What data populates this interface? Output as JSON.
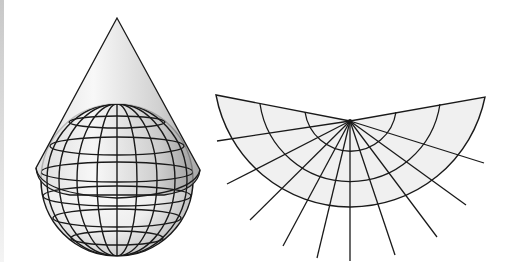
{
  "figure": {
    "panels": [
      {
        "id": "cone-globe",
        "label": "Cone placed over globe",
        "description": "A cone touching a globe along a standard parallel; globe shows a graticule of meridians and parallels"
      },
      {
        "id": "flattened-cone",
        "label": "Unrolled cone (conic projection)",
        "description": "Cone cut and flattened into a fan-shaped sector; meridians radiate from the apex, parallels are concentric arcs"
      }
    ]
  },
  "graticule": {
    "globe_meridians_visible": 7,
    "globe_parallels_visible": 6,
    "fan_meridians": 13,
    "fan_parallel_arcs": 3
  },
  "colors": {
    "line": "#1a1a1a",
    "fill": "#f0f0f0",
    "cone_shade_dark": "#9a9a9a",
    "cone_shade_light": "#f4f4f4",
    "background": "#ffffff"
  }
}
